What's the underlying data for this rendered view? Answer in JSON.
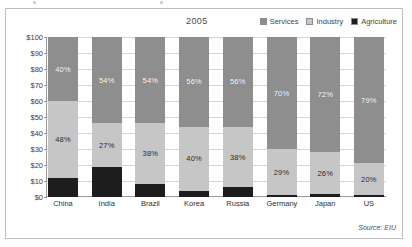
{
  "figure": {
    "frame_visible": true,
    "background": "#ffffff",
    "source_note": "Source: EIU"
  },
  "legend": {
    "position": "top-right",
    "items": [
      {
        "label": "Services",
        "color": "#8e8e8e",
        "icon": "legend-swatch-icon"
      },
      {
        "label": "Industry",
        "color": "#c6c6c6",
        "icon": "legend-swatch-icon"
      },
      {
        "label": "Agriculture",
        "color": "#1d1d1d",
        "icon": "legend-swatch-icon"
      }
    ]
  },
  "chart_data": {
    "type": "bar",
    "stacked": true,
    "title": "2005",
    "xlabel": "",
    "ylabel": "",
    "ylim": [
      0,
      100
    ],
    "ytick_labels": [
      "$100",
      "$90",
      "$80",
      "$70",
      "$60",
      "$50",
      "$40",
      "$30",
      "$20",
      "$10",
      "$0"
    ],
    "ytick_values": [
      100,
      90,
      80,
      70,
      60,
      50,
      40,
      30,
      20,
      10,
      0
    ],
    "grid": true,
    "legend_position": "top-right",
    "categories": [
      "China",
      "India",
      "Brazil",
      "Korea",
      "Russia",
      "Germany",
      "Japan",
      "US"
    ],
    "series": [
      {
        "name": "Agriculture",
        "color": "#1d1d1d",
        "values": [
          12,
          19,
          8,
          4,
          6,
          1,
          2,
          1
        ],
        "labels": [
          "",
          "",
          "",
          "",
          "",
          "",
          "",
          ""
        ]
      },
      {
        "name": "Industry",
        "color": "#c6c6c6",
        "values": [
          48,
          27,
          38,
          40,
          38,
          29,
          26,
          20
        ],
        "labels": [
          "48%",
          "27%",
          "38%",
          "40%",
          "38%",
          "29%",
          "26%",
          "20%"
        ]
      },
      {
        "name": "Services",
        "color": "#8e8e8e",
        "values": [
          40,
          54,
          54,
          56,
          56,
          70,
          72,
          79
        ],
        "labels": [
          "40%",
          "54%",
          "54%",
          "56%",
          "56%",
          "70%",
          "72%",
          "79%"
        ]
      }
    ]
  }
}
